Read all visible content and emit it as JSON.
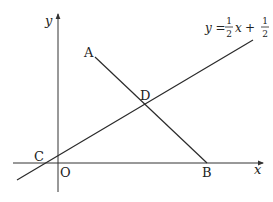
{
  "diagram": {
    "axes": {
      "x_label": "x",
      "y_label": "y",
      "origin_label": "O"
    },
    "line": {
      "equation_prefix": "y =",
      "slope_num": "1",
      "slope_den": "2",
      "var": "x",
      "plus": "+",
      "intercept_num": "1",
      "intercept_den": "2"
    },
    "points": {
      "A": "A",
      "B": "B",
      "C": "C",
      "D": "D"
    },
    "colors": {
      "stroke": "#2a2a2a",
      "background": "#ffffff"
    }
  }
}
